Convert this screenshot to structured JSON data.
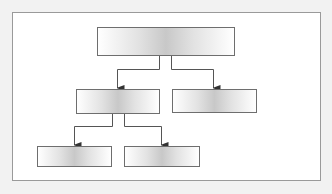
{
  "colors": {
    "background": "#f2f2f2",
    "frame_border": "#9a9a9a",
    "node_border": "#6e6e6e",
    "connector": "#555555"
  },
  "diagram": {
    "type": "tree",
    "nodes": [
      {
        "id": "root",
        "label": "",
        "level": 0
      },
      {
        "id": "child-1",
        "label": "",
        "level": 1,
        "parent": "root"
      },
      {
        "id": "child-2",
        "label": "",
        "level": 1,
        "parent": "root"
      },
      {
        "id": "grandchild-1",
        "label": "",
        "level": 2,
        "parent": "child-1"
      },
      {
        "id": "grandchild-2",
        "label": "",
        "level": 2,
        "parent": "child-1"
      }
    ]
  }
}
